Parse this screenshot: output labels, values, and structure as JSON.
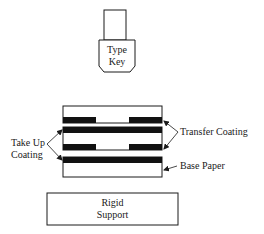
{
  "diagram": {
    "title": "",
    "type_key": {
      "line1": "Type",
      "line2": "Key"
    },
    "labels": {
      "transfer_coating": "Transfer Coating",
      "take_up_line1": "Take Up",
      "take_up_line2": "Coating",
      "base_paper": "Base Paper"
    },
    "rigid_support": {
      "line1": "Rigid",
      "line2": "Support"
    },
    "colors": {
      "stroke": "#1a1a1a",
      "fill_dark": "#111111",
      "background": "#ffffff"
    },
    "layers": [
      {
        "name": "top-sheet",
        "y": 106,
        "height": 17,
        "band": "bottom-gapped"
      },
      {
        "name": "middle-sheet",
        "y": 127,
        "height": 23,
        "band": "top-full-bottom-gapped"
      },
      {
        "name": "base-paper-sheet",
        "y": 157,
        "height": 20,
        "band": "top-full"
      }
    ]
  }
}
